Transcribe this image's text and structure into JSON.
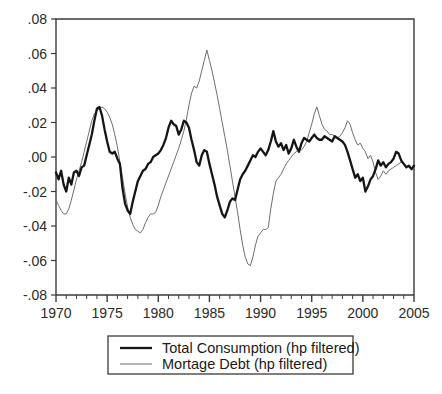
{
  "chart_data": {
    "type": "line",
    "title": "",
    "subtitle": "",
    "xlabel": "",
    "ylabel": "",
    "xlim": [
      1970,
      2005
    ],
    "ylim": [
      -0.08,
      0.08
    ],
    "grid": false,
    "legend_position": "bottom-center",
    "x_ticks": [
      "1970",
      "1975",
      "1980",
      "1985",
      "1990",
      "1995",
      "2000",
      "2005"
    ],
    "x_tick_values": [
      1970,
      1975,
      1980,
      1985,
      1990,
      1995,
      2000,
      2005
    ],
    "x_minor_tick_interval": 1,
    "y_ticks": [
      ".08",
      ".06",
      ".04",
      ".02",
      ".00",
      "-.02",
      "-.04",
      "-.06",
      "-.08"
    ],
    "y_tick_values": [
      0.08,
      0.06,
      0.04,
      0.02,
      0.0,
      -0.02,
      -0.04,
      -0.06,
      -0.08
    ],
    "x_start": 1970.0,
    "x_step": 0.25,
    "series": [
      {
        "name": "Total Consumption (hp filtered)",
        "color": "#151515",
        "width": 2.3,
        "values": [
          -0.009,
          -0.013,
          -0.008,
          -0.016,
          -0.02,
          -0.012,
          -0.016,
          -0.009,
          -0.008,
          -0.011,
          -0.006,
          -0.005,
          0.001,
          0.007,
          0.013,
          0.021,
          0.028,
          0.029,
          0.024,
          0.016,
          0.009,
          0.003,
          0.002,
          0.003,
          -0.001,
          -0.004,
          -0.018,
          -0.027,
          -0.031,
          -0.033,
          -0.026,
          -0.02,
          -0.014,
          -0.011,
          -0.008,
          -0.007,
          -0.004,
          -0.003,
          0.0,
          0.001,
          0.002,
          0.004,
          0.007,
          0.011,
          0.017,
          0.021,
          0.019,
          0.018,
          0.013,
          0.016,
          0.021,
          0.02,
          0.017,
          0.01,
          0.004,
          -0.003,
          -0.005,
          0.001,
          0.004,
          0.003,
          -0.004,
          -0.01,
          -0.016,
          -0.023,
          -0.028,
          -0.033,
          -0.035,
          -0.031,
          -0.026,
          -0.024,
          -0.025,
          -0.019,
          -0.013,
          -0.01,
          -0.008,
          -0.005,
          -0.002,
          0.001,
          0.0,
          0.003,
          0.005,
          0.003,
          0.001,
          0.004,
          0.009,
          0.015,
          0.009,
          0.006,
          0.008,
          0.004,
          0.007,
          0.002,
          0.005,
          0.01,
          0.006,
          0.003,
          0.008,
          0.011,
          0.01,
          0.009,
          0.011,
          0.013,
          0.011,
          0.01,
          0.01,
          0.012,
          0.011,
          0.01,
          0.009,
          0.012,
          0.011,
          0.01,
          0.009,
          0.007,
          0.003,
          -0.002,
          -0.007,
          -0.012,
          -0.01,
          -0.014,
          -0.012,
          -0.02,
          -0.017,
          -0.013,
          -0.011,
          -0.007,
          -0.002,
          -0.005,
          -0.003,
          -0.006,
          -0.004,
          -0.003,
          -0.001,
          0.003,
          0.002,
          -0.002,
          -0.004,
          -0.006,
          -0.005,
          -0.007,
          -0.005,
          -0.004,
          -0.006,
          -0.008,
          -0.007,
          -0.009,
          -0.011,
          -0.008,
          -0.006,
          -0.007,
          -0.005,
          -0.004,
          -0.006,
          -0.004,
          -0.002,
          0.0,
          0.002,
          0.004,
          0.006,
          0.01,
          0.013,
          0.017,
          0.019,
          0.018,
          0.016,
          0.016,
          0.013,
          0.01,
          0.007,
          0.003,
          0.001,
          -0.002,
          -0.001,
          -0.004,
          -0.002,
          -0.006,
          -0.005,
          -0.008,
          -0.006,
          -0.008,
          -0.007,
          -0.009,
          -0.007,
          -0.004,
          -0.006,
          -0.003,
          -0.001,
          -0.003,
          0.0,
          0.001,
          0.0,
          0.002,
          0.003
        ]
      },
      {
        "name": "Mortage Debt (hp filtered)",
        "color": "#6e6e6e",
        "width": 1.0,
        "values": [
          -0.025,
          -0.028,
          -0.031,
          -0.033,
          -0.033,
          -0.03,
          -0.025,
          -0.019,
          -0.013,
          -0.008,
          -0.003,
          0.003,
          0.009,
          0.015,
          0.021,
          0.025,
          0.027,
          0.028,
          0.029,
          0.028,
          0.026,
          0.023,
          0.019,
          0.013,
          0.006,
          -0.003,
          -0.012,
          -0.021,
          -0.029,
          -0.035,
          -0.039,
          -0.042,
          -0.043,
          -0.044,
          -0.042,
          -0.038,
          -0.035,
          -0.033,
          -0.033,
          -0.032,
          -0.028,
          -0.023,
          -0.019,
          -0.015,
          -0.011,
          -0.007,
          -0.003,
          0.001,
          0.005,
          0.01,
          0.015,
          0.022,
          0.03,
          0.037,
          0.041,
          0.04,
          0.044,
          0.05,
          0.056,
          0.062,
          0.056,
          0.05,
          0.043,
          0.036,
          0.028,
          0.02,
          0.012,
          0.004,
          -0.005,
          -0.014,
          -0.023,
          -0.032,
          -0.042,
          -0.051,
          -0.058,
          -0.062,
          -0.063,
          -0.058,
          -0.051,
          -0.046,
          -0.044,
          -0.042,
          -0.042,
          -0.041,
          -0.03,
          -0.021,
          -0.014,
          -0.012,
          -0.01,
          -0.007,
          -0.004,
          -0.002,
          0.0,
          0.002,
          0.003,
          0.005,
          0.004,
          0.006,
          0.009,
          0.014,
          0.019,
          0.025,
          0.029,
          0.024,
          0.019,
          0.016,
          0.015,
          0.013,
          0.013,
          0.012,
          0.011,
          0.012,
          0.014,
          0.017,
          0.021,
          0.019,
          0.014,
          0.01,
          0.007,
          0.008,
          0.005,
          0.003,
          -0.001,
          0.001,
          -0.003,
          -0.009,
          -0.013,
          -0.011,
          -0.008,
          -0.01,
          -0.008,
          -0.007,
          -0.006,
          -0.005,
          -0.004,
          -0.003,
          -0.004,
          -0.005,
          -0.006,
          -0.007,
          -0.008,
          -0.009,
          -0.008,
          -0.009,
          -0.01,
          -0.011,
          -0.01,
          -0.009,
          -0.008,
          -0.007,
          -0.006,
          -0.007,
          -0.006,
          -0.005,
          -0.006,
          -0.005,
          -0.004,
          -0.005,
          -0.004,
          -0.002,
          0.0,
          0.003,
          0.007,
          0.011,
          0.008,
          0.004,
          0.0,
          -0.004,
          -0.007,
          -0.01,
          -0.013,
          -0.016,
          -0.017,
          -0.015,
          -0.012,
          -0.01,
          -0.007,
          -0.004,
          -0.001,
          0.002,
          0.005,
          0.008,
          0.006,
          0.009,
          0.012,
          0.01,
          0.009,
          0.011,
          0.013,
          0.016,
          0.018,
          0.019,
          0.018
        ]
      }
    ]
  },
  "legend": {
    "entries": [
      {
        "label": "Total Consumption (hp filtered)"
      },
      {
        "label": "Mortage Debt (hp filtered)"
      }
    ]
  },
  "caption": ""
}
